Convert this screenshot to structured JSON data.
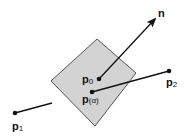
{
  "diagram": {
    "colors": {
      "plane_fill": "#d3d3d3",
      "plane_stroke": "#555555",
      "line": "#111111",
      "background": "#ffffff"
    },
    "plane": {
      "points": "97,39 136,73 95,126 51,81"
    },
    "normal": {
      "label": "n",
      "from": [
        99,
        79
      ],
      "to": [
        156,
        18
      ]
    },
    "segment": {
      "from": [
        15,
        113
      ],
      "to": [
        169,
        71
      ]
    },
    "points": [
      {
        "id": "p0",
        "label": "p",
        "sub": "0",
        "x": 99,
        "y": 79
      },
      {
        "id": "p_alpha",
        "label": "p",
        "sub": "(α)",
        "x": 92,
        "y": 92
      },
      {
        "id": "p1",
        "label": "p",
        "sub": "1",
        "x": 15,
        "y": 113
      },
      {
        "id": "p2",
        "label": "p",
        "sub": "2",
        "x": 169,
        "y": 71
      }
    ]
  }
}
